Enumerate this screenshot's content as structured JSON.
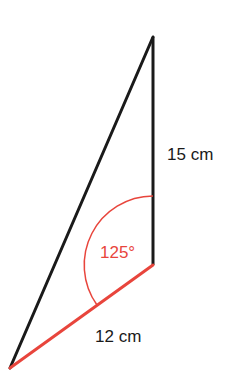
{
  "diagram": {
    "type": "triangle",
    "vertices": {
      "top": [
        153,
        37
      ],
      "corner": [
        153,
        265
      ],
      "bottom_left": [
        10,
        368
      ]
    },
    "sides": [
      {
        "name": "vertical-side",
        "label": "15 cm",
        "color": "#1a1a1a"
      },
      {
        "name": "base-side",
        "label": "12 cm",
        "color": "#e8453c"
      },
      {
        "name": "hypotenuse",
        "label": "",
        "color": "#1a1a1a"
      }
    ],
    "angle": {
      "label": "125°",
      "color": "#e8453c",
      "vertex": "corner"
    }
  },
  "labels": {
    "side_15": "15 cm",
    "side_12": "12 cm",
    "angle_125": "125°"
  },
  "colors": {
    "line": "#1a1a1a",
    "accent": "#e8453c",
    "background": "#ffffff"
  }
}
